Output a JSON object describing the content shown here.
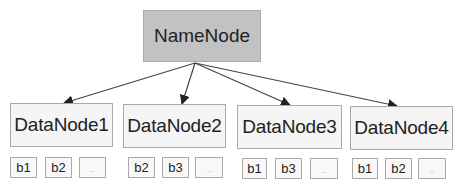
{
  "diagram": {
    "namenode": {
      "label": "NameNode",
      "fill_color": "#c2c2c2"
    },
    "datanodes": [
      {
        "label": "DataNode1",
        "blocks": [
          "b1",
          "b2",
          ".."
        ]
      },
      {
        "label": "DataNode2",
        "blocks": [
          "b2",
          "b3",
          ".."
        ]
      },
      {
        "label": "DataNode3",
        "blocks": [
          "b1",
          "b3",
          ".."
        ]
      },
      {
        "label": "DataNode4",
        "blocks": [
          "b1",
          "b2",
          ".."
        ]
      }
    ],
    "edges": [
      {
        "from": "NameNode",
        "to": "DataNode1"
      },
      {
        "from": "NameNode",
        "to": "DataNode2"
      },
      {
        "from": "NameNode",
        "to": "DataNode3"
      },
      {
        "from": "NameNode",
        "to": "DataNode4"
      }
    ],
    "colors": {
      "datanode_fill": "#f5f5f5",
      "border": "#a9a9a9",
      "arrow": "#333333",
      "text": "#222222"
    }
  }
}
